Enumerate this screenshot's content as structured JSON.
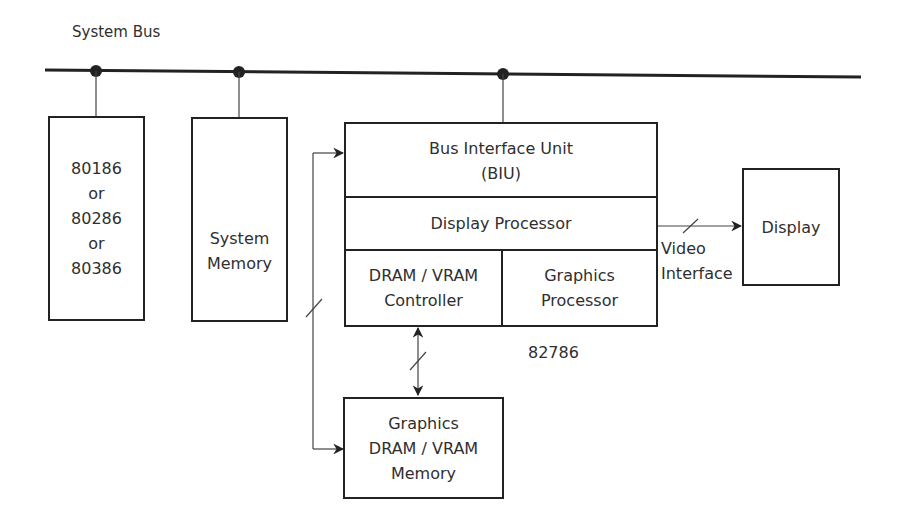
{
  "diagram": {
    "bus": {
      "label": "System Bus"
    },
    "cpu": {
      "lines": [
        "80186",
        "or",
        "80286",
        "or",
        "80386"
      ]
    },
    "system_memory": {
      "lines": [
        "System",
        "Memory"
      ]
    },
    "chip": {
      "name": "82786",
      "biu": {
        "lines": [
          "Bus Interface Unit",
          "(BIU)"
        ]
      },
      "display_processor": {
        "label": "Display Processor"
      },
      "dram_controller": {
        "lines": [
          "DRAM / VRAM",
          "Controller"
        ]
      },
      "graphics_processor": {
        "lines": [
          "Graphics",
          "Processor"
        ]
      }
    },
    "video_interface": {
      "lines": [
        "Video",
        "Interface"
      ]
    },
    "display": {
      "label": "Display"
    },
    "graphics_memory": {
      "lines": [
        "Graphics",
        "DRAM / VRAM",
        "Memory"
      ]
    }
  }
}
